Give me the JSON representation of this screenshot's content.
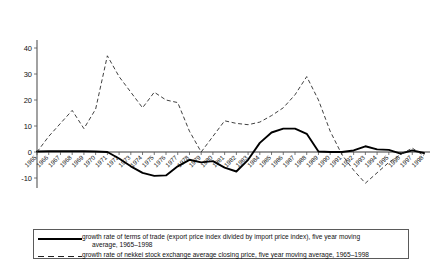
{
  "chart_data": {
    "type": "line",
    "title": "",
    "xlabel": "",
    "ylabel": "",
    "ylim": [
      -20,
      40
    ],
    "xlim": [
      1965,
      1998
    ],
    "grid": false,
    "legend_position": "bottom",
    "yticks": [
      40,
      30,
      20,
      10,
      0,
      -10
    ],
    "ytick_labels": [
      "40",
      "30",
      "20",
      "10",
      "0",
      "-10"
    ],
    "categories": [
      "1965",
      "1966",
      "1967",
      "1968",
      "1969",
      "1970",
      "1971",
      "1972",
      "1973",
      "1974",
      "1975",
      "1976",
      "1977",
      "1978",
      "1979",
      "1980",
      "1981",
      "1982",
      "1983",
      "1984",
      "1985",
      "1986",
      "1987",
      "1988",
      "1989",
      "1990",
      "1991",
      "1992",
      "1993",
      "1994",
      "1995",
      "1996",
      "1997",
      "1998"
    ],
    "series": [
      {
        "name": "growth rate of terms of trade (export price index divided by import price index), five year moving average, 1965–1998",
        "style": "solid",
        "color": "#000000",
        "values": [
          0.2,
          0.3,
          0.3,
          0.3,
          0.3,
          0.2,
          0.0,
          -2.5,
          -5.5,
          -8.0,
          -9.2,
          -9.0,
          -5.5,
          -3.0,
          -4.0,
          -3.5,
          -6.0,
          -7.5,
          -3.0,
          3.5,
          7.5,
          9.0,
          9.0,
          7.0,
          0.2,
          0.0,
          0.0,
          0.6,
          2.2,
          1.0,
          0.8,
          -0.6,
          0.6,
          -0.4
        ]
      },
      {
        "name": "growth rate of nekkei stock exchange average closing price, five year moving average, 1965–1998",
        "style": "dashed",
        "color": "#2a2a2a",
        "values": [
          0.0,
          6.0,
          11.0,
          16.0,
          9.0,
          16.5,
          37.0,
          29.0,
          23.0,
          17.0,
          23.0,
          20.0,
          19.0,
          8.0,
          0.0,
          6.0,
          12.0,
          11.0,
          10.5,
          11.5,
          14.0,
          17.0,
          22.0,
          29.0,
          20.0,
          8.0,
          -1.0,
          -7.0,
          -12.0,
          -8.0,
          -4.0,
          -1.0,
          1.5,
          -1.5
        ]
      }
    ]
  },
  "legend": {
    "items": [
      {
        "sample": "solid-line-sample",
        "line1": "growth rate of terms of trade (export price index divided by import price index), five year moving",
        "line2": "average, 1965–1998"
      },
      {
        "sample": "dashed-line-sample",
        "line1": "growth rate of nekkei stock exchange average closing price, five year moving average, 1965–1998",
        "line2": ""
      }
    ]
  }
}
